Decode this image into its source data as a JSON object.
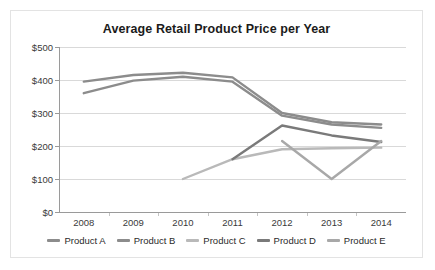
{
  "chart_data": {
    "type": "line",
    "title": "Average Retail Product Price per Year",
    "xlabel": "",
    "ylabel": "",
    "x": [
      "2008",
      "2009",
      "2010",
      "2011",
      "2012",
      "2013",
      "2014"
    ],
    "categories": [
      "2008",
      "2009",
      "2010",
      "2011",
      "2012",
      "2013",
      "2014"
    ],
    "ylim": [
      0,
      500
    ],
    "ytick_values": [
      0,
      100,
      200,
      300,
      400,
      500
    ],
    "ytick_labels": [
      "$0",
      "$100",
      "$200",
      "$300",
      "$400",
      "$500"
    ],
    "grid": true,
    "legend_position": "bottom",
    "series": [
      {
        "name": "Product A",
        "color": "#8c8c8c",
        "values": [
          395,
          415,
          422,
          408,
          300,
          272,
          265
        ]
      },
      {
        "name": "Product B",
        "color": "#8c8c8c",
        "values": [
          360,
          398,
          410,
          395,
          292,
          265,
          255
        ]
      },
      {
        "name": "Product C",
        "color": "#b9b9b9",
        "values": [
          null,
          null,
          100,
          160,
          190,
          193,
          195
        ]
      },
      {
        "name": "Product D",
        "color": "#7a7a7a",
        "values": [
          null,
          null,
          null,
          160,
          262,
          232,
          212
        ]
      },
      {
        "name": "Product E",
        "color": "#a8a8a8",
        "values": [
          null,
          null,
          null,
          null,
          215,
          100,
          215
        ]
      }
    ]
  },
  "legend": {
    "items": [
      {
        "label": "Product A",
        "color": "#8c8c8c"
      },
      {
        "label": "Product B",
        "color": "#8c8c8c"
      },
      {
        "label": "Product C",
        "color": "#b9b9b9"
      },
      {
        "label": "Product D",
        "color": "#7a7a7a"
      },
      {
        "label": "Product E",
        "color": "#a8a8a8"
      }
    ]
  }
}
